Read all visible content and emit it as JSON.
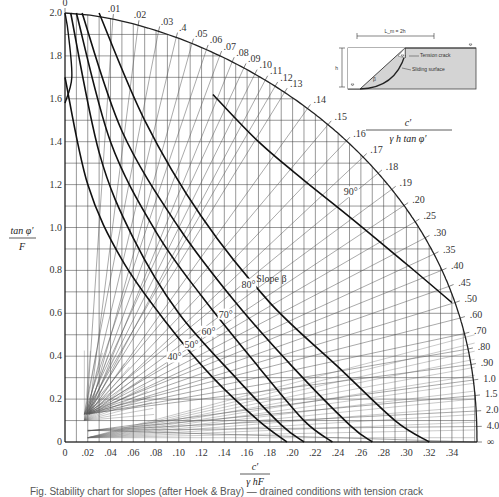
{
  "chart_data": {
    "type": "line",
    "xlabel": "c' / (γ h F)",
    "ylabel": "tan φ' / F",
    "arc_label": "c' / (γ h tan φ')",
    "xlim": [
      0,
      0.36
    ],
    "ylim": [
      0,
      2.0
    ],
    "grid": true,
    "x_ticks": [
      "0",
      ".02",
      ".04",
      ".06",
      ".08",
      ".10",
      ".12",
      ".14",
      ".16",
      ".18",
      ".20",
      ".22",
      ".24",
      ".26",
      ".28",
      ".30",
      ".32",
      ".34"
    ],
    "x_tick_values": [
      0,
      0.02,
      0.04,
      0.06,
      0.08,
      0.1,
      0.12,
      0.14,
      0.16,
      0.18,
      0.2,
      0.22,
      0.24,
      0.26,
      0.28,
      0.3,
      0.32,
      0.34
    ],
    "y_ticks": [
      "0",
      "0.2",
      "0.4",
      "0.6",
      "0.8",
      "1.0",
      "1.2",
      "1.4",
      "1.6",
      "1.8",
      "2.0"
    ],
    "y_tick_values": [
      0,
      0.2,
      0.4,
      0.6,
      0.8,
      1.0,
      1.2,
      1.4,
      1.6,
      1.8,
      2.0
    ],
    "arc_ticks": [
      "0",
      ".01",
      ".02",
      ".03",
      ".4",
      ".05",
      ".06",
      ".07",
      ".08",
      ".09",
      ".10",
      ".11",
      ".12",
      ".13",
      ".14",
      ".15",
      ".16",
      ".17",
      ".18",
      ".19",
      ".20",
      ".25",
      ".30",
      ".35",
      ".40",
      ".45",
      ".50",
      ".60",
      ".70",
      ".80",
      ".90",
      "1.0",
      "1.5",
      "2.0",
      "4.0",
      "∞"
    ],
    "arc_tick_values": [
      0,
      0.01,
      0.02,
      0.03,
      0.04,
      0.05,
      0.06,
      0.07,
      0.08,
      0.09,
      0.1,
      0.11,
      0.12,
      0.13,
      0.14,
      0.15,
      0.16,
      0.17,
      0.18,
      0.19,
      0.2,
      0.25,
      0.3,
      0.35,
      0.4,
      0.45,
      0.5,
      0.6,
      0.7,
      0.8,
      0.9,
      1.0,
      1.5,
      2.0,
      4.0,
      "inf"
    ],
    "series": [
      {
        "name": "40°",
        "label_at": [
          0.09,
          0.38
        ],
        "points": [
          [
            0.0,
            1.7
          ],
          [
            0.02,
            1.2
          ],
          [
            0.05,
            0.85
          ],
          [
            0.09,
            0.55
          ],
          [
            0.13,
            0.3
          ],
          [
            0.17,
            0.1
          ],
          [
            0.195,
            0.0
          ]
        ]
      },
      {
        "name": "50°",
        "label_at": [
          0.105,
          0.44
        ],
        "points": [
          [
            0.005,
            2.0
          ],
          [
            0.03,
            1.35
          ],
          [
            0.06,
            0.95
          ],
          [
            0.1,
            0.6
          ],
          [
            0.15,
            0.3
          ],
          [
            0.19,
            0.08
          ],
          [
            0.21,
            0.0
          ]
        ]
      },
      {
        "name": "60°",
        "label_at": [
          0.12,
          0.5
        ],
        "points": [
          [
            0.01,
            2.0
          ],
          [
            0.04,
            1.4
          ],
          [
            0.08,
            0.98
          ],
          [
            0.12,
            0.68
          ],
          [
            0.17,
            0.35
          ],
          [
            0.21,
            0.1
          ],
          [
            0.235,
            0.0
          ]
        ]
      },
      {
        "name": "70°",
        "label_at": [
          0.135,
          0.58
        ],
        "points": [
          [
            0.015,
            2.0
          ],
          [
            0.05,
            1.45
          ],
          [
            0.1,
            1.0
          ],
          [
            0.15,
            0.65
          ],
          [
            0.2,
            0.35
          ],
          [
            0.25,
            0.08
          ],
          [
            0.27,
            0.0
          ]
        ]
      },
      {
        "name": "80°",
        "label_at": [
          0.155,
          0.72
        ],
        "points": [
          [
            0.03,
            2.0
          ],
          [
            0.07,
            1.5
          ],
          [
            0.12,
            1.05
          ],
          [
            0.18,
            0.65
          ],
          [
            0.24,
            0.35
          ],
          [
            0.29,
            0.1
          ],
          [
            0.32,
            0.0
          ]
        ]
      },
      {
        "name": "90°",
        "label_at": [
          0.245,
          1.15
        ],
        "points": [
          [
            0.13,
            1.62
          ],
          [
            0.17,
            1.4
          ],
          [
            0.21,
            1.22
          ],
          [
            0.25,
            1.05
          ],
          [
            0.3,
            0.83
          ],
          [
            0.34,
            0.65
          ]
        ]
      }
    ],
    "slope_title": "Slope β",
    "inset": {
      "dimension_label": "L_m = 2h",
      "height_label": "h",
      "tension_crack_label": "Tension crack",
      "sliding_surface_label": "Sliding surface",
      "angle_label": "β"
    }
  },
  "caption": "Fig. Stability chart for slopes (after Hoek & Bray) — drained conditions with tension crack"
}
